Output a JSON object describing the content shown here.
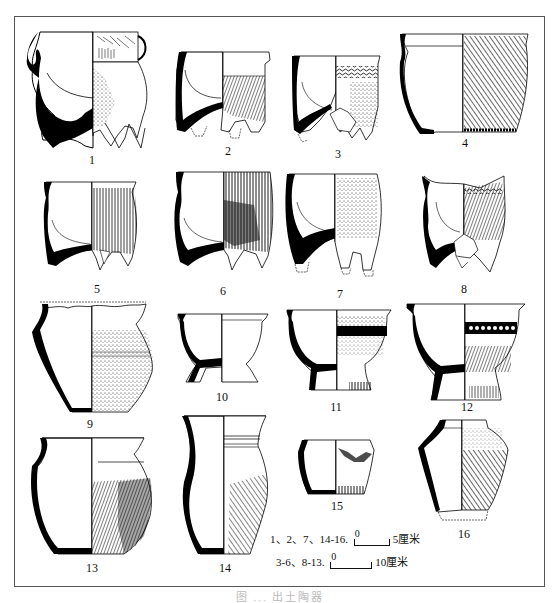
{
  "figure": {
    "vessels": [
      {
        "id": "1",
        "label": "1"
      },
      {
        "id": "2",
        "label": "2"
      },
      {
        "id": "3",
        "label": "3"
      },
      {
        "id": "4",
        "label": "4"
      },
      {
        "id": "5",
        "label": "5"
      },
      {
        "id": "6",
        "label": "6"
      },
      {
        "id": "7",
        "label": "7"
      },
      {
        "id": "8",
        "label": "8"
      },
      {
        "id": "9",
        "label": "9"
      },
      {
        "id": "10",
        "label": "10"
      },
      {
        "id": "11",
        "label": "11"
      },
      {
        "id": "12",
        "label": "12"
      },
      {
        "id": "13",
        "label": "13"
      },
      {
        "id": "14",
        "label": "14"
      },
      {
        "id": "15",
        "label": "15"
      },
      {
        "id": "16",
        "label": "16"
      }
    ],
    "scales": [
      {
        "items": "1、2、7、14-16.",
        "zero": "0",
        "max": "5",
        "unit": "厘米"
      },
      {
        "items": "3-6、8-13.",
        "zero": "0",
        "max": "10",
        "unit": "厘米"
      }
    ],
    "caption": "图 ...  出土陶器"
  }
}
